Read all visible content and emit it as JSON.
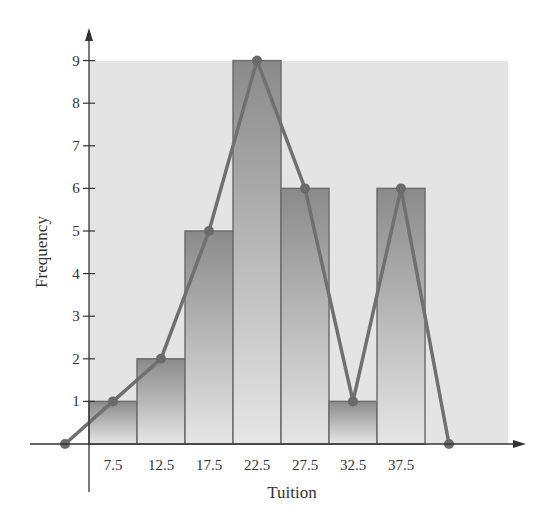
{
  "chart_data": {
    "type": "bar",
    "title": "",
    "xlabel": "Tuition",
    "ylabel": "Frequency",
    "categories": [
      "7.5",
      "12.5",
      "17.5",
      "22.5",
      "27.5",
      "32.5",
      "37.5"
    ],
    "values": [
      1,
      2,
      5,
      9,
      6,
      1,
      6
    ],
    "ylim": [
      0,
      9
    ],
    "yticks": [
      1,
      2,
      3,
      4,
      5,
      6,
      7,
      8,
      9
    ],
    "series": [
      {
        "name": "Histogram",
        "type": "bar",
        "values": [
          1,
          2,
          5,
          9,
          6,
          1,
          6
        ]
      },
      {
        "name": "Frequency polygon",
        "type": "line",
        "x": [
          2.5,
          7.5,
          12.5,
          17.5,
          22.5,
          27.5,
          32.5,
          37.5,
          42.5
        ],
        "values": [
          0,
          1,
          2,
          5,
          9,
          6,
          1,
          6,
          0
        ]
      }
    ],
    "grid": false,
    "legend": null
  },
  "colors": {
    "background_panel": "#e4e4e4",
    "bar_top": "#8a8a8a",
    "bar_bottom": "#e6e6e6",
    "bar_edge": "#6e6e6e",
    "polygon_line": "#707070",
    "axis": "#333333"
  }
}
